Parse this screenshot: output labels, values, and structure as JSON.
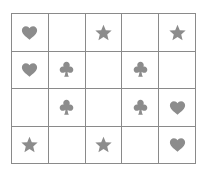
{
  "canvas": {
    "width": 208,
    "height": 177,
    "background_color": "#ffffff"
  },
  "grid": {
    "name": "symbol-grid",
    "columns": 5,
    "rows": 4,
    "border_color": "#8a8a8a",
    "cell_background": "#ffffff",
    "symbol_color": "#8c8c8c",
    "symbol_names": {
      "heart": "heart-icon",
      "star": "star-icon",
      "club": "club-icon",
      "empty": "empty-cell"
    },
    "cells": [
      [
        {
          "symbol": "heart",
          "label": "♥"
        },
        {
          "symbol": "empty",
          "label": ""
        },
        {
          "symbol": "star",
          "label": "★"
        },
        {
          "symbol": "empty",
          "label": ""
        },
        {
          "symbol": "star",
          "label": "★"
        }
      ],
      [
        {
          "symbol": "heart",
          "label": "♥"
        },
        {
          "symbol": "club",
          "label": "♣"
        },
        {
          "symbol": "empty",
          "label": ""
        },
        {
          "symbol": "club",
          "label": "♣"
        },
        {
          "symbol": "empty",
          "label": ""
        }
      ],
      [
        {
          "symbol": "empty",
          "label": ""
        },
        {
          "symbol": "club",
          "label": "♣"
        },
        {
          "symbol": "empty",
          "label": ""
        },
        {
          "symbol": "club",
          "label": "♣"
        },
        {
          "symbol": "heart",
          "label": "♥"
        }
      ],
      [
        {
          "symbol": "star",
          "label": "★"
        },
        {
          "symbol": "empty",
          "label": ""
        },
        {
          "symbol": "star",
          "label": "★"
        },
        {
          "symbol": "empty",
          "label": ""
        },
        {
          "symbol": "heart",
          "label": "♥"
        }
      ]
    ]
  }
}
